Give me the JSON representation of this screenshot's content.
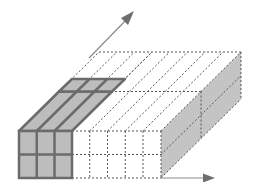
{
  "diagram": {
    "title": "3D block partition with highlighted slab",
    "colors": {
      "solid_fill": "#bdbdbd",
      "solid_stroke": "#6b6b6b",
      "dotted_stroke": "#555555",
      "right_face_fill": "#c4c4c4",
      "arrow": "#7a7a7a",
      "background": "#ffffff"
    },
    "grid": {
      "front_columns": 8,
      "front_rows": 2,
      "depth_divisions": 2,
      "highlighted_columns": 3
    },
    "arrows": [
      {
        "name": "depth-axis-arrow",
        "direction": "up-right"
      },
      {
        "name": "x-axis-arrow",
        "direction": "right"
      }
    ]
  }
}
